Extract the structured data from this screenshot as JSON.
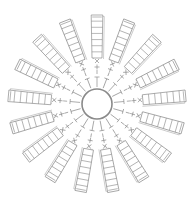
{
  "diagram": {
    "type": "crochet-chart",
    "center": {
      "x": 97,
      "y": 104
    },
    "ring": {
      "radius": 15
    },
    "petals": {
      "count": 17,
      "start_angle_deg": -90,
      "inner_radius": 46,
      "outer_radius": 89,
      "width": 10,
      "rungs": 7
    },
    "stitch_symbols": [
      "chain-line",
      "t-bar",
      "cross",
      "x-mark"
    ],
    "colors": {
      "line": "#8c8c8c",
      "ring": "#8a8a8a",
      "background": "#ffffff"
    }
  }
}
